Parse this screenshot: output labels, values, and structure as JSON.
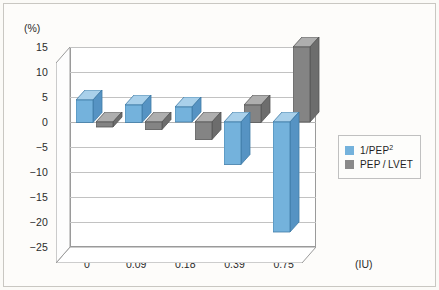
{
  "chart_data": {
    "type": "bar",
    "title": "",
    "subtitle": "",
    "xlabel": "(IU)",
    "ylabel": "(%)",
    "categories": [
      "0",
      "0.09",
      "0.18",
      "0.39",
      "0.75"
    ],
    "series": [
      {
        "name": "1/PEP²",
        "color": "#74b2dc",
        "values": [
          4.5,
          3.5,
          3.0,
          -8.5,
          -22.0
        ]
      },
      {
        "name": "PEP/LVET",
        "color": "#848484",
        "values": [
          -1.0,
          -1.5,
          -3.5,
          3.5,
          15.0
        ]
      }
    ],
    "ylim": [
      -25,
      15
    ],
    "ytick_step": 5,
    "yticks": [
      "15",
      "10",
      "5",
      "0",
      "-5",
      "-10",
      "-15",
      "-20",
      "-25"
    ],
    "grid": true,
    "three_d": true,
    "legend_position": "right"
  },
  "axes": {
    "y_unit_label": "(%)",
    "x_unit_label": "(IU)"
  },
  "legend": {
    "entries": [
      {
        "label_main": "1/PEP",
        "label_sup": "2",
        "swatch": "blue-swatch"
      },
      {
        "label_main": "PEP / LVET",
        "label_sup": "",
        "swatch": "gray-swatch"
      }
    ]
  },
  "colors": {
    "series_blue": "#74b2dc",
    "series_gray": "#848484",
    "background": "#fbfaf7",
    "grid": "#c2c2c2"
  }
}
